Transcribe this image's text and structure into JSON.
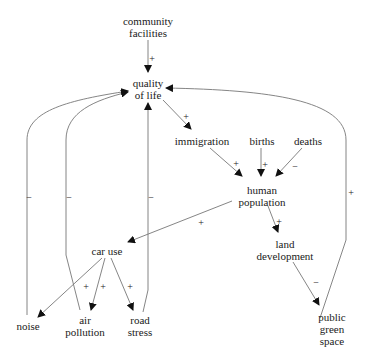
{
  "diagram": {
    "type": "causal-loop",
    "nodes": {
      "community_facilities": {
        "line1": "community",
        "line2": "facilities"
      },
      "quality_of_life": {
        "line1": "quality",
        "line2": "of life"
      },
      "immigration": {
        "line1": "immigration"
      },
      "births": {
        "line1": "births"
      },
      "deaths": {
        "line1": "deaths"
      },
      "human_population": {
        "line1": "human",
        "line2": "population"
      },
      "car_use": {
        "line1": "car use"
      },
      "land_development": {
        "line1": "land",
        "line2": "development"
      },
      "noise": {
        "line1": "noise"
      },
      "air_pollution": {
        "line1": "air",
        "line2": "pollution"
      },
      "road_stress": {
        "line1": "road",
        "line2": "stress"
      },
      "public_green_space": {
        "line1": "public",
        "line2": "green",
        "line3": "space"
      }
    },
    "edges": [
      {
        "from": "community facilities",
        "to": "quality of life",
        "polarity": "+"
      },
      {
        "from": "quality of life",
        "to": "immigration",
        "polarity": "+"
      },
      {
        "from": "immigration",
        "to": "human population",
        "polarity": "+"
      },
      {
        "from": "births",
        "to": "human population",
        "polarity": "+"
      },
      {
        "from": "deaths",
        "to": "human population",
        "polarity": "−"
      },
      {
        "from": "human population",
        "to": "car use",
        "polarity": "+"
      },
      {
        "from": "human population",
        "to": "land development",
        "polarity": "+"
      },
      {
        "from": "land development",
        "to": "public green space",
        "polarity": "−"
      },
      {
        "from": "car use",
        "to": "noise",
        "polarity": "+"
      },
      {
        "from": "car use",
        "to": "air pollution",
        "polarity": "+"
      },
      {
        "from": "car use",
        "to": "road stress",
        "polarity": "+"
      },
      {
        "from": "noise",
        "to": "quality of life",
        "polarity": "−"
      },
      {
        "from": "air pollution",
        "to": "quality of life",
        "polarity": "−"
      },
      {
        "from": "road stress",
        "to": "quality of life",
        "polarity": "−"
      },
      {
        "from": "public green space",
        "to": "quality of life",
        "polarity": "+"
      }
    ],
    "polarity_labels": {
      "cf_qol": "+",
      "qol_imm": "+",
      "imm_hp": "+",
      "births_hp": "+",
      "deaths_hp": "−",
      "hp_car": "+",
      "hp_land": "+",
      "land_green": "−",
      "car_noise": "+",
      "car_air": "+",
      "car_road": "+",
      "noise_qol": "−",
      "air_qol": "−",
      "road_qol": "−",
      "green_qol": "+"
    }
  }
}
